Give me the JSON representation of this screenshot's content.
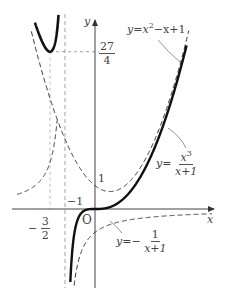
{
  "chart_data": {
    "type": "line",
    "title": "",
    "xlabel": "x",
    "ylabel": "y",
    "origin_label": "O",
    "xlim": [
      -2.6,
      3.9
    ],
    "ylim": [
      -3.6,
      8.9
    ],
    "grid": false,
    "series": [
      {
        "name": "y = x^3/(x+1)",
        "style": "solid-thick",
        "role": "main curve",
        "key_points": [
          {
            "x": -1.5,
            "y": 6.75,
            "note": "local minimum"
          },
          {
            "x": 0,
            "y": 0,
            "note": "inflection/origin"
          }
        ]
      },
      {
        "name": "y = x^2 - x + 1",
        "style": "dashed",
        "role": "asymptotic parabola",
        "key_points": [
          {
            "x": 0,
            "y": 1
          }
        ]
      },
      {
        "name": "y = -1/(x+1)",
        "style": "dashed",
        "role": "difference curve",
        "key_points": [
          {
            "x": 0,
            "y": -1
          }
        ]
      }
    ],
    "asymptotes": [
      {
        "x": -1,
        "style": "dashed"
      }
    ],
    "guides": [
      {
        "type": "vertical",
        "x": -1.5,
        "style": "dashed"
      },
      {
        "type": "horizontal",
        "y": 6.75,
        "style": "dashed"
      }
    ],
    "tick_labels": {
      "x": [
        {
          "value": -1.5,
          "label": "-3/2"
        },
        {
          "value": -1,
          "label": "-1"
        }
      ],
      "y": [
        {
          "value": 1,
          "label": "1"
        },
        {
          "value": 6.75,
          "label": "27/4"
        }
      ]
    },
    "annotations": [
      {
        "text": "y=x²−x+1",
        "points_to": "parabola"
      },
      {
        "text": "y=x³/(x+1)",
        "points_to": "main curve"
      },
      {
        "text": "y=−1/(x+1)",
        "points_to": "hyperbola"
      }
    ]
  },
  "labels": {
    "y_axis": "y",
    "x_axis": "x",
    "origin": "O",
    "y_tick_27": "27",
    "y_tick_4": "4",
    "y_tick_1": "1",
    "x_tick_neg1": "−1",
    "x_tick_minus": "−",
    "x_tick_3": "3",
    "x_tick_2": "2",
    "parabola_lhs": "y",
    "parabola_eq": "=",
    "parabola_x": "x",
    "parabola_exp": "2",
    "parabola_rest": "−x+1",
    "main_lhs": "y",
    "main_eq": "=",
    "main_num": "x",
    "main_num_exp": "3",
    "main_den": "x+1",
    "hyp_lhs": "y",
    "hyp_eq": "=−",
    "hyp_num": "1",
    "hyp_den": "x+1"
  }
}
